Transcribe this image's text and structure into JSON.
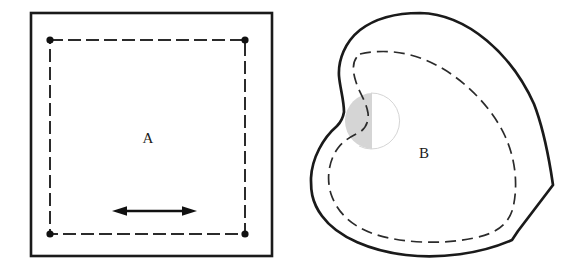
{
  "figure": {
    "background_color": "#ffffff",
    "stroke_color": "#1a1a1a",
    "dash_color": "#2b2b2b",
    "shade_color": "#d5d5d5",
    "panels": [
      {
        "id": "A",
        "label": "A",
        "label_x": 148,
        "label_y": 140,
        "outline_type": "square",
        "outline_stroke_width": 2.6,
        "inner_contour_type": "dashed-square",
        "inner_dash_pattern": "13 5",
        "corner_markers": 4,
        "corner_marker_radius": 3.6,
        "arrow": {
          "type": "double-headed-horizontal",
          "x_start": 112,
          "x_end": 197,
          "y": 211
        }
      },
      {
        "id": "B",
        "label": "B",
        "label_x": 424,
        "label_y": 155,
        "outline_type": "closed-freeform-blob",
        "outline_stroke_width": 2.6,
        "inner_contour_type": "dashed-freeform",
        "inner_dash_pattern": "11 6",
        "shaded_region": {
          "shape": "crescent-lune",
          "fill": "#d5d5d5",
          "center_x": 379,
          "center_y": 120,
          "radius": 28
        },
        "notch": {
          "side": "left",
          "x": 344,
          "y": 112
        }
      }
    ]
  },
  "geometry": {
    "panel_a": {
      "outer_square": {
        "x": 31,
        "y": 13,
        "width": 241,
        "height": 243
      },
      "dashed_square": {
        "x": 50,
        "y": 40,
        "width": 195,
        "height": 194
      },
      "dots": [
        {
          "x": 50,
          "y": 40
        },
        {
          "x": 245,
          "y": 40
        },
        {
          "x": 50,
          "y": 234
        },
        {
          "x": 245,
          "y": 234
        }
      ]
    },
    "panel_b": {
      "bounds": {
        "x_min": 311,
        "y_min": 13,
        "x_max": 553,
        "y_max": 257
      },
      "right_vertex": {
        "x": 551,
        "y": 185
      },
      "bottom_vertex": {
        "x": 512,
        "y": 240
      },
      "left_extreme": {
        "x": 311,
        "y": 180
      },
      "top_extreme": {
        "x": 420,
        "y": 13
      }
    }
  }
}
